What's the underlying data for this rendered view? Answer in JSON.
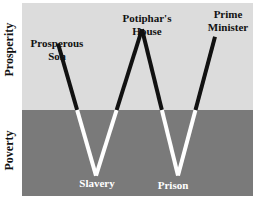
{
  "axis": {
    "upper_label": "Prosperity",
    "lower_label": "Poverty"
  },
  "colors": {
    "prosperity_band": "#dcdcdc",
    "poverty_band": "#7a7a7a",
    "line_in_prosperity": "#111111",
    "line_in_poverty": "#ffffff"
  },
  "points": [
    {
      "label_line1": "Prosperous",
      "label_line2": "Son",
      "zone": "prosperity",
      "level": 0.7
    },
    {
      "label_line1": "Slavery",
      "label_line2": "",
      "zone": "poverty",
      "level": -0.82
    },
    {
      "label_line1": "Potiphar's",
      "label_line2": "House",
      "zone": "prosperity",
      "level": 0.85
    },
    {
      "label_line1": "Prison",
      "label_line2": "",
      "zone": "poverty",
      "level": -0.82
    },
    {
      "label_line1": "Prime",
      "label_line2": "Minister",
      "zone": "prosperity",
      "level": 0.77
    }
  ]
}
